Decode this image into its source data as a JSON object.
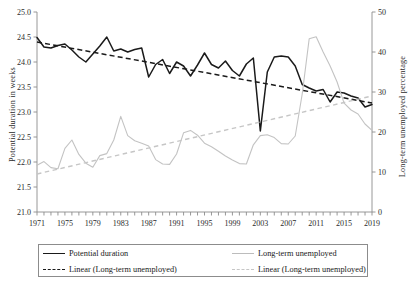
{
  "chart_data": {
    "type": "line",
    "title": "",
    "xlabel": "",
    "x_axis": {
      "min": 1971,
      "max": 2019,
      "tick_step": 1,
      "label_step": 4,
      "tick_labels": [
        "1971",
        "1975",
        "1979",
        "1983",
        "1987",
        "1991",
        "1995",
        "1999",
        "2003",
        "2007",
        "2011",
        "2015",
        "2019"
      ]
    },
    "y_axis_left": {
      "label": "Potential duration in weeks",
      "min": 21.0,
      "max": 25.0,
      "tick_step": 0.5,
      "tick_labels": [
        "21.0",
        "21.5",
        "22.0",
        "22.5",
        "23.0",
        "23.5",
        "24.0",
        "24.5",
        "25.0"
      ]
    },
    "y_axis_right": {
      "label": "Long-term unemployed percentage",
      "min": 0,
      "max": 50,
      "tick_step": 10,
      "tick_labels": [
        "0",
        "10",
        "20",
        "30",
        "40",
        "50"
      ]
    },
    "grid": false,
    "legend_position": "bottom",
    "x": [
      1971,
      1972,
      1973,
      1974,
      1975,
      1976,
      1977,
      1978,
      1979,
      1980,
      1981,
      1982,
      1983,
      1984,
      1985,
      1986,
      1987,
      1988,
      1989,
      1990,
      1991,
      1992,
      1993,
      1994,
      1995,
      1996,
      1997,
      1998,
      1999,
      2000,
      2001,
      2002,
      2003,
      2004,
      2005,
      2006,
      2007,
      2008,
      2009,
      2010,
      2011,
      2012,
      2013,
      2014,
      2015,
      2016,
      2017,
      2018,
      2019
    ],
    "series": [
      {
        "name": "Potential duration",
        "axis": "left",
        "color": "#1a1a1a",
        "style": "solid",
        "values": [
          24.49,
          24.3,
          24.28,
          24.33,
          24.36,
          24.24,
          24.1,
          24.0,
          24.16,
          24.32,
          24.5,
          24.22,
          24.26,
          24.2,
          24.25,
          24.28,
          23.7,
          23.95,
          24.05,
          23.77,
          24.0,
          23.92,
          23.72,
          23.94,
          24.18,
          23.95,
          23.88,
          24.02,
          23.83,
          23.72,
          23.96,
          24.08,
          22.62,
          23.8,
          24.1,
          24.12,
          24.1,
          23.92,
          23.55,
          23.48,
          23.42,
          23.45,
          23.2,
          23.4,
          23.38,
          23.32,
          23.28,
          23.1,
          23.15
        ]
      },
      {
        "name": "Long-term unemployed",
        "axis": "right",
        "color": "#c3c3c3",
        "style": "solid",
        "values": [
          11.7,
          12.6,
          11.1,
          10.8,
          15.9,
          18.0,
          14.4,
          12.2,
          11.2,
          14.1,
          14.6,
          18.0,
          23.9,
          19.1,
          17.8,
          17.2,
          16.5,
          13.1,
          12.0,
          11.9,
          14.5,
          19.8,
          20.4,
          19.2,
          17.2,
          16.3,
          15.2,
          14.0,
          13.0,
          12.1,
          12.0,
          16.8,
          19.1,
          19.3,
          18.6,
          17.1,
          17.0,
          19.0,
          29.5,
          43.3,
          43.8,
          40.0,
          36.5,
          32.5,
          27.2,
          25.5,
          24.5,
          22.0,
          20.4
        ]
      },
      {
        "name": "Linear (Long-term unemployed)",
        "axis": "left",
        "color": "#1a1a1a",
        "style": "dashed",
        "trend_from": 24.4,
        "trend_to": 23.18
      },
      {
        "name": "Linear (Long-term unemployed)",
        "axis": "right",
        "color": "#c6c6c6",
        "style": "dashed",
        "trend_from": 9.5,
        "trend_to": 29.0
      }
    ]
  },
  "legend": {
    "entries": [
      {
        "label": "Potential duration",
        "swatch": "solid-dark"
      },
      {
        "label": "Long-term unemployed",
        "swatch": "solid-gray"
      },
      {
        "label": "Linear (Long-term unemployed)",
        "swatch": "dash-dark"
      },
      {
        "label": "Linear (Long-term unemployed)",
        "swatch": "dash-gray"
      }
    ]
  }
}
